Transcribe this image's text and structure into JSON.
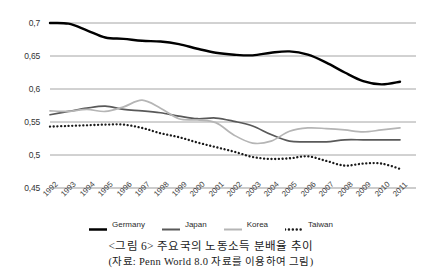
{
  "chart_data": {
    "type": "line",
    "title": "",
    "xlabel": "",
    "ylabel": "",
    "grid": true,
    "legend_position": "bottom",
    "ylim": [
      0.45,
      0.7
    ],
    "yticks": [
      "0,45",
      "0,5",
      "0,55",
      "0,6",
      "0,65",
      "0,7"
    ],
    "ytick_values": [
      0.45,
      0.5,
      0.55,
      0.6,
      0.65,
      0.7
    ],
    "categories": [
      "1992",
      "1993",
      "1994",
      "1995",
      "1996",
      "1997",
      "1998",
      "1999",
      "2000",
      "2001",
      "2002",
      "2003",
      "2004",
      "2005",
      "2006",
      "2007",
      "2008",
      "2009",
      "2010",
      "2011"
    ],
    "series": [
      {
        "name": "Germany",
        "color": "#000000",
        "style": "solid-thick",
        "values": [
          0.7,
          0.699,
          0.689,
          0.678,
          0.676,
          0.673,
          0.672,
          0.668,
          0.661,
          0.655,
          0.652,
          0.651,
          0.655,
          0.657,
          0.652,
          0.64,
          0.625,
          0.612,
          0.607,
          0.611
        ]
      },
      {
        "name": "Japan",
        "color": "#595959",
        "style": "solid",
        "values": [
          0.561,
          0.566,
          0.571,
          0.574,
          0.569,
          0.567,
          0.564,
          0.559,
          0.555,
          0.556,
          0.551,
          0.544,
          0.531,
          0.521,
          0.52,
          0.52,
          0.523,
          0.523,
          0.523,
          0.523
        ]
      },
      {
        "name": "Korea",
        "color": "#b5b5b5",
        "style": "solid",
        "values": [
          0.567,
          0.566,
          0.569,
          0.566,
          0.573,
          0.583,
          0.571,
          0.555,
          0.553,
          0.549,
          0.53,
          0.518,
          0.521,
          0.536,
          0.541,
          0.54,
          0.538,
          0.535,
          0.538,
          0.541
        ]
      },
      {
        "name": "Taiwan",
        "color": "#1a1a1a",
        "style": "dotted",
        "values": [
          0.543,
          0.544,
          0.545,
          0.546,
          0.546,
          0.541,
          0.533,
          0.527,
          0.519,
          0.512,
          0.505,
          0.497,
          0.494,
          0.495,
          0.498,
          0.491,
          0.484,
          0.487,
          0.487,
          0.479
        ]
      }
    ]
  },
  "legend": {
    "items": [
      {
        "label": "Germany"
      },
      {
        "label": "Japan"
      },
      {
        "label": "Korea"
      },
      {
        "label": "Taiwan"
      }
    ]
  },
  "caption": {
    "title": "<그림 6> 주요국의 노동소득 분배율 추이",
    "source": "(자료: Penn World 8.0 자료를 이용하여 그림)"
  }
}
